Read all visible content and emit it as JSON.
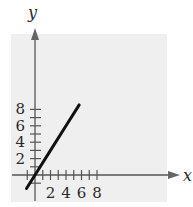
{
  "chart_data": {
    "type": "line",
    "title": "",
    "xlabel": "x",
    "ylabel": "y",
    "xlim": [
      -1,
      8.5
    ],
    "ylim": [
      -1.5,
      9
    ],
    "x_ticks": [
      2,
      4,
      6,
      8
    ],
    "y_ticks": [
      2,
      4,
      6,
      8
    ],
    "minor_tick_step": 1,
    "grid": false,
    "background_color": "#efefef",
    "line_color": "#111111",
    "series": [
      {
        "name": "y = (3/2)x",
        "x": [
          -1.1,
          0,
          2,
          4,
          5.7
        ],
        "y": [
          -1.65,
          0,
          3,
          6,
          8.55
        ]
      }
    ]
  }
}
